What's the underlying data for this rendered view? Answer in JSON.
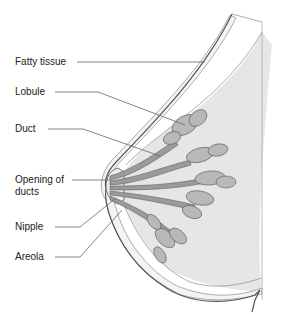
{
  "diagram": {
    "labels": [
      {
        "id": "fatty-tissue",
        "text": "Fatty tissue"
      },
      {
        "id": "lobule",
        "text": "Lobule"
      },
      {
        "id": "duct",
        "text": "Duct"
      },
      {
        "id": "opening-of-ducts",
        "text": "Opening of\nducts",
        "line1": "Opening of",
        "line2": "ducts"
      },
      {
        "id": "nipple",
        "text": "Nipple"
      },
      {
        "id": "areola",
        "text": "Areola"
      }
    ],
    "colors": {
      "background": "#ffffff",
      "tissue_fill": "#e6e6e6",
      "fat_layer": "#f4f4f4",
      "duct_fill": "#9a9a9a",
      "lobule_fill": "#b8b8b8",
      "outline": "#555555",
      "leader_line": "#666666",
      "text": "#222222"
    }
  }
}
